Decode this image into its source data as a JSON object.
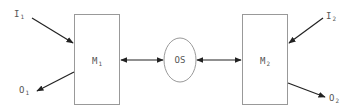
{
  "diagram": {
    "nodes": [
      {
        "id": "M1",
        "label": "M",
        "subscript": "1",
        "shape": "rectangle"
      },
      {
        "id": "OS",
        "label": "OS",
        "shape": "ellipse"
      },
      {
        "id": "M2",
        "label": "M",
        "subscript": "2",
        "shape": "rectangle"
      }
    ],
    "inputs": [
      {
        "id": "I1",
        "label": "I",
        "subscript": "1",
        "target": "M1"
      },
      {
        "id": "I2",
        "label": "I",
        "subscript": "2",
        "target": "M2"
      }
    ],
    "outputs": [
      {
        "id": "O1",
        "label": "O",
        "subscript": "1",
        "source": "M1"
      },
      {
        "id": "O2",
        "label": "O",
        "subscript": "2",
        "source": "M2"
      }
    ],
    "edges": [
      {
        "from": "I1",
        "to": "M1",
        "type": "directed"
      },
      {
        "from": "M1",
        "to": "O1",
        "type": "directed"
      },
      {
        "from": "M1",
        "to": "OS",
        "type": "bidirectional"
      },
      {
        "from": "OS",
        "to": "M2",
        "type": "bidirectional"
      },
      {
        "from": "I2",
        "to": "M2",
        "type": "directed"
      },
      {
        "from": "M2",
        "to": "O2",
        "type": "directed"
      }
    ],
    "colors": {
      "box_stroke": "#999999",
      "arrow": "#222222",
      "text": "#555555"
    }
  }
}
